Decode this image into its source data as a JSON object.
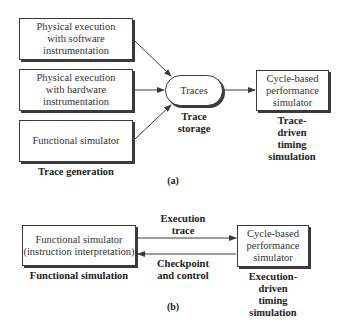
{
  "part_a": {
    "sources": [
      {
        "label": "Physical execution\nwith software\ninstrumentation"
      },
      {
        "label": "Physical execution\nwith hardware\ninstrumentation"
      },
      {
        "label": "Functional simulator"
      }
    ],
    "sources_caption": "Trace generation",
    "storage": {
      "label": "Traces",
      "caption": "Trace\nstorage"
    },
    "simulator": {
      "label": "Cycle-based\nperformance\nsimulator",
      "caption": "Trace-driven\ntiming simulation"
    },
    "figure_label": "(a)"
  },
  "part_b": {
    "functional": {
      "label": "Functional simulator\n(instruction interpretation)",
      "caption": "Functional simulation"
    },
    "simulator": {
      "label": "Cycle-based\nperformance\nsimulator",
      "caption": "Execution-driven\ntiming simulation"
    },
    "forward_arrow_label": "Execution\ntrace",
    "backward_arrow_label": "Checkpoint\nand control",
    "figure_label": "(b)"
  },
  "colors": {
    "line": "#3a3a3a",
    "text": "#333333",
    "background": "#ffffff"
  }
}
